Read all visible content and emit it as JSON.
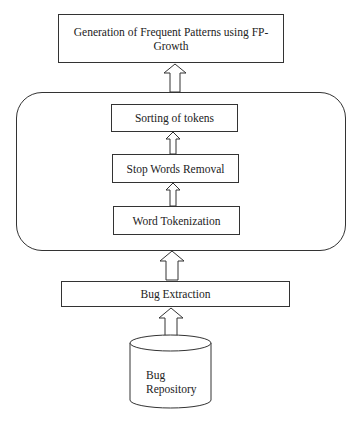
{
  "diagram": {
    "top_box": {
      "line1": "Generation of Frequent Patterns using FP-",
      "line2": "Growth"
    },
    "preprocessing_group": {
      "steps": [
        {
          "label": "Sorting of tokens"
        },
        {
          "label": "Stop Words Removal"
        },
        {
          "label": "Word Tokenization"
        }
      ]
    },
    "bug_extraction": {
      "label": "Bug Extraction"
    },
    "repository": {
      "line1": "Bug",
      "line2": "Repository"
    }
  },
  "colors": {
    "stroke": "#333333",
    "fill": "#ffffff",
    "text": "#222222"
  }
}
